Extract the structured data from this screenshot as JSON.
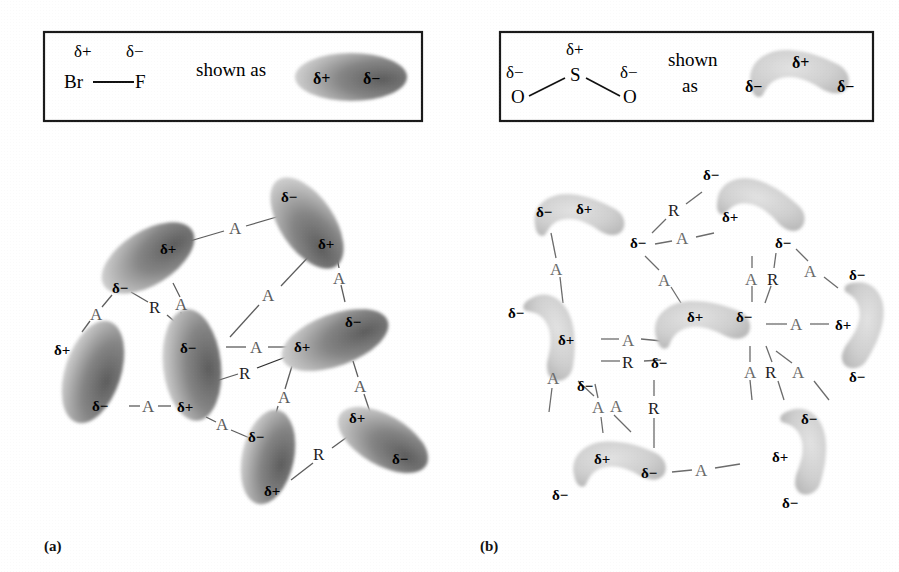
{
  "figure": {
    "background_color": "#ffffff",
    "width": 899,
    "height": 572,
    "panel_labels": [
      {
        "id": "a",
        "text": "(a)",
        "x": 44,
        "y": 538
      },
      {
        "id": "b",
        "text": "(b)",
        "x": 480,
        "y": 538
      }
    ]
  },
  "glyphs": {
    "delta_plus": "δ+",
    "delta_minus": "δ−",
    "attraction": "A",
    "repulsion": "R"
  },
  "legend_a": {
    "box": {
      "x": 44,
      "y": 32,
      "width": 378,
      "height": 89
    },
    "molecule": {
      "top_labels": [
        {
          "text": "δ+",
          "x": 74,
          "y": 48
        },
        {
          "text": "δ−",
          "x": 128,
          "y": 48
        }
      ],
      "atoms": [
        {
          "text": "Br",
          "x": 68,
          "y": 74
        },
        {
          "text": "F",
          "x": 139,
          "y": 74
        }
      ],
      "bond": {
        "x1": 92,
        "y1": 84,
        "x2": 136,
        "y2": 84
      }
    },
    "shown_as_text": "shown as",
    "shown_as_pos": {
      "x": 196,
      "y": 65
    },
    "shape": {
      "type": "ellipse",
      "cx": 351,
      "cy": 77,
      "rx": 56,
      "ry": 24,
      "rotation": 0,
      "gradient": {
        "light_end": "δ+",
        "dark_end": "δ−",
        "light": "#cccccc",
        "dark": "#6e6e6e"
      },
      "labels": [
        {
          "text": "δ+",
          "x": 322,
          "y": 78
        },
        {
          "text": "δ−",
          "x": 372,
          "y": 78
        }
      ]
    }
  },
  "legend_b": {
    "box": {
      "x": 500,
      "y": 32,
      "width": 373,
      "height": 89
    },
    "molecule": {
      "labels": [
        {
          "text": "δ+",
          "x": 573,
          "y": 46
        },
        {
          "text": "δ−",
          "x": 512,
          "y": 69
        },
        {
          "text": "δ−",
          "x": 626,
          "y": 69
        }
      ],
      "atoms": [
        {
          "text": "S",
          "x": 573,
          "y": 73
        },
        {
          "text": "O",
          "x": 516,
          "y": 96
        },
        {
          "text": "O",
          "x": 625,
          "y": 96
        }
      ],
      "bonds": [
        {
          "x1": 530,
          "y1": 94,
          "x2": 566,
          "y2": 76
        },
        {
          "x1": 586,
          "y1": 76,
          "x2": 621,
          "y2": 94
        }
      ]
    },
    "shown_as_lines": [
      "shown",
      "as"
    ],
    "shown_as_pos": {
      "x": 672,
      "y": 58
    },
    "shape": {
      "type": "boomerang",
      "cx": 800,
      "cy": 76,
      "fill": "#c6c6c6",
      "labels": [
        {
          "text": "δ−",
          "x": 753,
          "y": 86
        },
        {
          "text": "δ+",
          "x": 800,
          "y": 62
        },
        {
          "text": "δ−",
          "x": 848,
          "y": 86
        }
      ]
    }
  },
  "panel_a": {
    "caption": "(a)",
    "description": "Network of BrF dipoles (ellipses) linked by attraction (A) and repulsion (R) labels",
    "molecule_type": "ellipse",
    "molecules": [
      {
        "id": "a1",
        "cx": 148,
        "cy": 258,
        "rx": 52,
        "ry": 27,
        "angle": -32,
        "plus": {
          "x": 170,
          "y": 248
        },
        "minus": {
          "x": 124,
          "y": 287
        }
      },
      {
        "id": "a2",
        "cx": 307,
        "cy": 223,
        "rx": 52,
        "ry": 27,
        "angle": 54,
        "minus": {
          "x": 290,
          "y": 203
        },
        "plus": {
          "x": 327,
          "y": 245
        }
      },
      {
        "id": "a3",
        "cx": 93,
        "cy": 372,
        "rx": 27,
        "ry": 52,
        "angle": 18,
        "plus": {
          "x": 64,
          "y": 350
        },
        "minus": {
          "x": 104,
          "y": 403
        }
      },
      {
        "id": "a4",
        "cx": 192,
        "cy": 363,
        "rx": 28,
        "ry": 55,
        "angle": -5,
        "minus": {
          "x": 194,
          "y": 352
        },
        "plus": {
          "x": 189,
          "y": 404
        }
      },
      {
        "id": "a5",
        "cx": 332,
        "cy": 340,
        "rx": 56,
        "ry": 26,
        "angle": -22,
        "plus": {
          "x": 301,
          "y": 348
        },
        "minus": {
          "x": 360,
          "y": 325
        }
      },
      {
        "id": "a6",
        "cx": 268,
        "cy": 455,
        "rx": 26,
        "ry": 48,
        "angle": 12,
        "minus": {
          "x": 259,
          "y": 436
        },
        "plus": {
          "x": 277,
          "y": 487
        }
      },
      {
        "id": "a7",
        "cx": 382,
        "cy": 438,
        "rx": 50,
        "ry": 25,
        "angle": 28,
        "plus": {
          "x": 358,
          "y": 419
        },
        "minus": {
          "x": 404,
          "y": 457
        }
      }
    ],
    "bonds": [
      {
        "label": "A",
        "kind": "attraction",
        "x1": 190,
        "y1": 242,
        "x2": 275,
        "y2": 217,
        "lx": 234,
        "ly": 227
      },
      {
        "label": "A",
        "kind": "attraction",
        "x1": 172,
        "y1": 282,
        "x2": 180,
        "y2": 327,
        "lx": 180,
        "ly": 303
      },
      {
        "label": "R",
        "kind": "repulsion",
        "x1": 130,
        "y1": 292,
        "x2": 178,
        "y2": 330,
        "lx": 156,
        "ly": 307
      },
      {
        "label": "A",
        "kind": "attraction",
        "x1": 113,
        "y1": 294,
        "x2": 88,
        "y2": 330,
        "lx": 96,
        "ly": 313
      },
      {
        "label": "A",
        "kind": "attraction",
        "x1": 315,
        "y1": 251,
        "x2": 232,
        "y2": 340,
        "lx": 270,
        "ly": 295
      },
      {
        "label": "A",
        "kind": "attraction",
        "x1": 335,
        "y1": 250,
        "x2": 345,
        "y2": 300,
        "lx": 338,
        "ly": 276
      },
      {
        "label": "A",
        "kind": "attraction",
        "x1": 227,
        "y1": 346,
        "x2": 288,
        "y2": 346,
        "lx": 257,
        "ly": 348
      },
      {
        "label": "R",
        "kind": "repulsion",
        "x1": 215,
        "y1": 380,
        "x2": 297,
        "y2": 352,
        "lx": 246,
        "ly": 372
      },
      {
        "label": "A",
        "kind": "attraction",
        "x1": 128,
        "y1": 405,
        "x2": 172,
        "y2": 405,
        "lx": 148,
        "ly": 407
      },
      {
        "label": "A",
        "kind": "attraction",
        "x1": 205,
        "y1": 416,
        "x2": 252,
        "y2": 438,
        "lx": 222,
        "ly": 427
      },
      {
        "label": "A",
        "kind": "attraction",
        "x1": 291,
        "y1": 365,
        "x2": 272,
        "y2": 430,
        "lx": 281,
        "ly": 397
      },
      {
        "label": "A",
        "kind": "attraction",
        "x1": 355,
        "y1": 360,
        "x2": 370,
        "y2": 412,
        "lx": 361,
        "ly": 385
      },
      {
        "label": "R",
        "kind": "repulsion",
        "x1": 290,
        "y1": 480,
        "x2": 355,
        "y2": 430,
        "lx": 322,
        "ly": 455
      }
    ]
  },
  "panel_b": {
    "caption": "(b)",
    "description": "Network of SO2 dipoles (boomerang shapes) linked by attraction (A) and repulsion (R) labels",
    "molecule_type": "boomerang",
    "molecules": [
      {
        "id": "b1",
        "cx": 580,
        "cy": 218,
        "scale": 1.0,
        "angle": 0,
        "labels": [
          {
            "t": "δ−",
            "x": 545,
            "y": 218
          },
          {
            "t": "δ+",
            "x": 583,
            "y": 214
          },
          {
            "t": "δ−",
            "x": 640,
            "y": 243
          }
        ]
      },
      {
        "id": "b2",
        "cx": 760,
        "cy": 205,
        "scale": 1.0,
        "angle": 15,
        "labels": [
          {
            "t": "δ−",
            "x": 712,
            "y": 177
          },
          {
            "t": "δ+",
            "x": 733,
            "y": 219
          },
          {
            "t": "δ−",
            "x": 785,
            "y": 243
          }
        ]
      },
      {
        "id": "b3",
        "cx": 547,
        "cy": 330,
        "scale": 1.0,
        "angle": 64,
        "labels": [
          {
            "t": "δ−",
            "x": 518,
            "y": 313
          },
          {
            "t": "δ+",
            "x": 570,
            "y": 340
          },
          {
            "t": "δ−",
            "x": 590,
            "y": 386
          }
        ]
      },
      {
        "id": "b4",
        "cx": 700,
        "cy": 325,
        "scale": 1.05,
        "angle": -4,
        "labels": [
          {
            "t": "δ+",
            "x": 695,
            "y": 320
          },
          {
            "t": "δ−",
            "x": 748,
            "y": 320
          },
          {
            "t": "δ−",
            "x": 662,
            "y": 363
          }
        ]
      },
      {
        "id": "b5",
        "cx": 855,
        "cy": 325,
        "scale": 0.95,
        "angle": 92,
        "labels": [
          {
            "t": "δ−",
            "x": 860,
            "y": 272
          },
          {
            "t": "δ+",
            "x": 845,
            "y": 325
          },
          {
            "t": "δ−",
            "x": 860,
            "y": 378
          }
        ]
      },
      {
        "id": "b6",
        "cx": 800,
        "cy": 450,
        "scale": 0.95,
        "angle": 78,
        "labels": [
          {
            "t": "δ−",
            "x": 812,
            "y": 420
          },
          {
            "t": "δ+",
            "x": 783,
            "y": 455
          },
          {
            "t": "δ−",
            "x": 792,
            "y": 502
          }
        ]
      },
      {
        "id": "b7",
        "cx": 620,
        "cy": 465,
        "scale": 1.0,
        "angle": -2,
        "labels": [
          {
            "t": "δ+",
            "x": 604,
            "y": 460
          },
          {
            "t": "δ−",
            "x": 652,
            "y": 474
          },
          {
            "t": "δ−",
            "x": 562,
            "y": 495
          }
        ]
      }
    ],
    "bonds": [
      {
        "label": "R",
        "kind": "repulsion",
        "x1": 651,
        "y1": 232,
        "x2": 700,
        "y2": 190,
        "lx": 676,
        "ly": 205
      },
      {
        "label": "A",
        "kind": "attraction",
        "x1": 653,
        "y1": 243,
        "x2": 713,
        "y2": 232,
        "lx": 683,
        "ly": 238
      },
      {
        "label": "A",
        "kind": "attraction",
        "x1": 551,
        "y1": 232,
        "x2": 562,
        "y2": 302,
        "lx": 558,
        "ly": 268
      },
      {
        "label": "A",
        "kind": "attraction",
        "x1": 646,
        "y1": 255,
        "x2": 678,
        "y2": 305,
        "lx": 665,
        "ly": 278
      },
      {
        "label": "A",
        "kind": "attraction",
        "x1": 752,
        "y1": 255,
        "x2": 752,
        "y2": 302,
        "lx": 752,
        "ly": 277
      },
      {
        "label": "R",
        "kind": "repulsion",
        "x1": 775,
        "y1": 252,
        "x2": 764,
        "y2": 302,
        "lx": 774,
        "ly": 277
      },
      {
        "label": "A",
        "kind": "attraction",
        "x1": 795,
        "y1": 248,
        "x2": 838,
        "y2": 285,
        "lx": 815,
        "ly": 270
      },
      {
        "label": "A",
        "kind": "attraction",
        "x1": 600,
        "y1": 338,
        "x2": 664,
        "y2": 345,
        "lx": 630,
        "ly": 340
      },
      {
        "label": "R",
        "kind": "repulsion",
        "x1": 600,
        "y1": 360,
        "x2": 660,
        "y2": 360,
        "lx": 630,
        "ly": 366
      },
      {
        "label": "A",
        "kind": "attraction",
        "x1": 765,
        "y1": 323,
        "x2": 828,
        "y2": 323,
        "lx": 798,
        "ly": 325
      },
      {
        "label": "A",
        "kind": "attraction",
        "x1": 750,
        "y1": 345,
        "x2": 752,
        "y2": 400,
        "lx": 751,
        "ly": 373
      },
      {
        "label": "R",
        "kind": "repulsion",
        "x1": 765,
        "y1": 345,
        "x2": 782,
        "y2": 400,
        "lx": 775,
        "ly": 372
      },
      {
        "label": "A",
        "kind": "attraction",
        "x1": 775,
        "y1": 350,
        "x2": 828,
        "y2": 400,
        "lx": 805,
        "ly": 372
      },
      {
        "label": "A",
        "kind": "attraction",
        "x1": 595,
        "y1": 383,
        "x2": 600,
        "y2": 432,
        "lx": 600,
        "ly": 408
      },
      {
        "label": "A",
        "kind": "attraction",
        "x1": 577,
        "y1": 380,
        "x2": 631,
        "y2": 432,
        "lx": 608,
        "ly": 405
      },
      {
        "label": "R",
        "kind": "repulsion",
        "x1": 655,
        "y1": 410,
        "x2": 655,
        "y2": 445,
        "lx": 655,
        "ly": 412
      },
      {
        "label": "A",
        "kind": "attraction",
        "x1": 560,
        "y1": 353,
        "x2": 551,
        "y2": 412,
        "lx": 556,
        "ly": 383
      },
      {
        "label": "A",
        "kind": "attraction",
        "x1": 670,
        "y1": 472,
        "x2": 740,
        "y2": 462,
        "lx": 704,
        "ly": 468
      }
    ]
  }
}
